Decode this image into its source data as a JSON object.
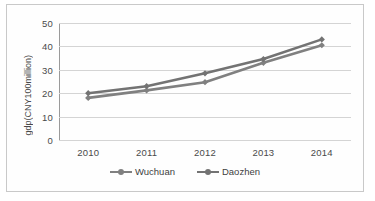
{
  "chart_data": {
    "type": "line",
    "title": "",
    "xlabel": "",
    "ylabel": "gdp(CNY100million)",
    "categories": [
      "2010",
      "2011",
      "2012",
      "2013",
      "2014"
    ],
    "x": [
      2010,
      2011,
      2012,
      2013,
      2014
    ],
    "series": [
      {
        "name": "Wuchuan",
        "values": [
          18.0,
          21.2,
          24.7,
          33.0,
          40.5
        ],
        "color": "#808080"
      },
      {
        "name": "Daozhen",
        "values": [
          20.0,
          23.0,
          28.5,
          34.6,
          43.0
        ],
        "color": "#737373"
      }
    ],
    "yticks": [
      0,
      10,
      20,
      30,
      40,
      50
    ],
    "ylim": [
      0,
      50
    ],
    "grid": "horizontal",
    "legend_position": "bottom",
    "marker": "diamond"
  },
  "axis": {
    "y_title": "gdp(CNY100million)",
    "y_tick_labels": [
      "50",
      "40",
      "30",
      "20",
      "10",
      "0"
    ],
    "x_tick_labels": [
      "2010",
      "2011",
      "2012",
      "2013",
      "2014"
    ]
  },
  "legend": {
    "items": [
      {
        "label": "Wuchuan"
      },
      {
        "label": "Daozhen"
      }
    ]
  },
  "colors": {
    "series_1": "#808080",
    "series_2": "#737373",
    "gridline": "#d4d4d4",
    "axis": "#9a9a9a",
    "frame_border": "#c9c9c9",
    "text": "#4a4a4a",
    "background": "#ffffff"
  }
}
